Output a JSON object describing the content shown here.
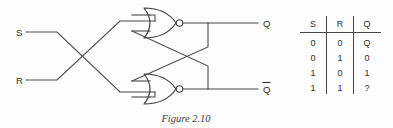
{
  "figure": {
    "caption": "Figure 2.10",
    "type": "logic-circuit-diagram"
  },
  "circuit": {
    "inputs": [
      {
        "label": "S",
        "name": "set-input"
      },
      {
        "label": "R",
        "name": "reset-input"
      }
    ],
    "outputs": [
      {
        "label": "Q",
        "name": "q-output",
        "overbar": false
      },
      {
        "label": "Q",
        "name": "q-bar-output",
        "overbar": true
      }
    ],
    "gates": [
      {
        "name": "nor-gate-top",
        "type": "NOR"
      },
      {
        "name": "nor-gate-bottom",
        "type": "NOR"
      }
    ]
  },
  "truth_table": {
    "headers": [
      "S",
      "R",
      "Q"
    ],
    "rows": [
      [
        "0",
        "0",
        "Q"
      ],
      [
        "0",
        "1",
        "0"
      ],
      [
        "1",
        "0",
        "1"
      ],
      [
        "1",
        "1",
        "?"
      ]
    ]
  },
  "colors": {
    "background": "#fdfdfd",
    "wire": "#4a4a4a",
    "gate": "#3f3f3f",
    "text": "#2b2b2b"
  }
}
